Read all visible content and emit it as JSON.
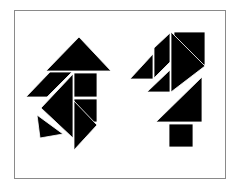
{
  "figure": {
    "type": "tangram-puzzle",
    "piece_color": "#000000",
    "background_color": "#ffffff",
    "frame_color": "#8a8a8a",
    "figures": [
      {
        "name": "left-figure",
        "pieces": [
          {
            "shape": "large-triangle",
            "points": "79,37 46,71 111,71"
          },
          {
            "shape": "parallelogram",
            "points": "26,97 50,72 72,72 47,97"
          },
          {
            "shape": "square",
            "points": "74,73 97,73 97,97 74,97"
          },
          {
            "shape": "large-triangle",
            "points": "73,74 41,108 73,138"
          },
          {
            "shape": "square-small",
            "points": "74,99 97,99 97,122 74,122"
          },
          {
            "shape": "medium-triangle",
            "points": "74,101 97,125 74,150"
          },
          {
            "shape": "small-triangle",
            "points": "37,115 40,138 63,134"
          }
        ]
      },
      {
        "name": "right-figure",
        "pieces": [
          {
            "shape": "square",
            "points": "174,32 205,32 205,65 174,65"
          },
          {
            "shape": "large-triangle",
            "points": "171,32 205,66 171,92"
          },
          {
            "shape": "parallelogram",
            "points": "154,48 170,33 170,62 154,78"
          },
          {
            "shape": "small-triangle",
            "points": "130,79 153,54 153,79"
          },
          {
            "shape": "small-triangle",
            "points": "147,92 170,70 170,92"
          },
          {
            "shape": "large-triangle",
            "points": "156,122 202,77 202,122"
          },
          {
            "shape": "square",
            "points": "169,124 193,124 193,147 169,147"
          }
        ]
      }
    ]
  }
}
